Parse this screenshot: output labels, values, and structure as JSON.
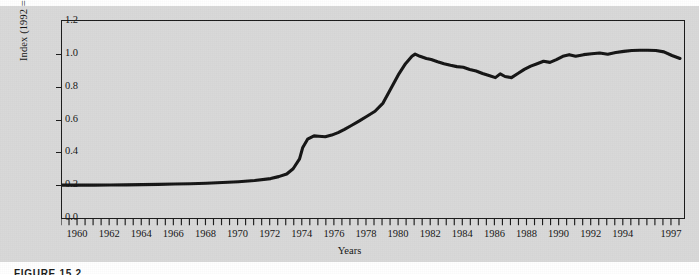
{
  "figure": {
    "caption": "FIGURE 15.2",
    "background_color": "#d9d9d9",
    "line_color": "#141414"
  },
  "chart_data": {
    "type": "line",
    "title": "",
    "subtitle": "",
    "xlabel": "Years",
    "ylabel": "Index (1992 = 1.0)",
    "xlim": [
      1959.0,
      1997.75
    ],
    "ylim": [
      0.0,
      1.2
    ],
    "grid": false,
    "legend": null,
    "legend_position": "none",
    "y_ticks": [
      "0.0",
      "0.2",
      "0.4",
      "0.6",
      "0.8",
      "1.0",
      "1.2"
    ],
    "y_tick_values": [
      0.0,
      0.2,
      0.4,
      0.6,
      0.8,
      1.0,
      1.2
    ],
    "x_ticks": [
      "1960",
      "1962",
      "1964",
      "1966",
      "1968",
      "1970",
      "1972",
      "1974",
      "1976",
      "1978",
      "1980",
      "1982",
      "1984",
      "1986",
      "1988",
      "1990",
      "1992",
      "1994",
      "1997"
    ],
    "x_tick_values": [
      1960,
      1962,
      1964,
      1966,
      1968,
      1970,
      1972,
      1974,
      1976,
      1978,
      1980,
      1982,
      1984,
      1986,
      1988,
      1990,
      1992,
      1994,
      1997
    ],
    "minor_tick_interval_years": 0.5,
    "series": [
      {
        "name": "Index (1992 = 1.0)",
        "x": [
          1959.0,
          1960.0,
          1961.0,
          1962.0,
          1963.0,
          1964.0,
          1965.0,
          1966.0,
          1967.0,
          1968.0,
          1969.0,
          1970.0,
          1971.0,
          1972.0,
          1972.5,
          1973.0,
          1973.4,
          1973.8,
          1974.0,
          1974.3,
          1974.7,
          1975.0,
          1975.4,
          1975.8,
          1976.2,
          1976.6,
          1977.0,
          1977.5,
          1978.0,
          1978.5,
          1979.0,
          1979.5,
          1980.0,
          1980.4,
          1980.8,
          1981.0,
          1981.3,
          1981.7,
          1982.0,
          1982.4,
          1982.8,
          1983.2,
          1983.6,
          1984.0,
          1984.4,
          1984.8,
          1985.2,
          1985.6,
          1986.0,
          1986.3,
          1986.6,
          1987.0,
          1987.4,
          1987.8,
          1988.2,
          1988.6,
          1989.0,
          1989.4,
          1989.8,
          1990.2,
          1990.6,
          1991.0,
          1991.5,
          1992.0,
          1992.5,
          1993.0,
          1993.5,
          1994.0,
          1994.5,
          1995.0,
          1995.5,
          1996.0,
          1996.5,
          1997.0,
          1997.5
        ],
        "y": [
          0.2,
          0.2,
          0.2,
          0.201,
          0.202,
          0.203,
          0.205,
          0.207,
          0.209,
          0.212,
          0.216,
          0.221,
          0.228,
          0.24,
          0.252,
          0.268,
          0.3,
          0.36,
          0.43,
          0.48,
          0.5,
          0.498,
          0.495,
          0.505,
          0.52,
          0.54,
          0.562,
          0.59,
          0.62,
          0.65,
          0.7,
          0.79,
          0.88,
          0.94,
          0.985,
          0.998,
          0.985,
          0.972,
          0.965,
          0.952,
          0.94,
          0.93,
          0.922,
          0.918,
          0.905,
          0.895,
          0.88,
          0.868,
          0.855,
          0.878,
          0.862,
          0.855,
          0.88,
          0.905,
          0.925,
          0.94,
          0.955,
          0.948,
          0.965,
          0.985,
          0.995,
          0.985,
          0.995,
          1.0,
          1.005,
          0.998,
          1.008,
          1.015,
          1.02,
          1.022,
          1.022,
          1.02,
          1.012,
          0.99,
          0.972
        ]
      }
    ],
    "annotations": []
  }
}
